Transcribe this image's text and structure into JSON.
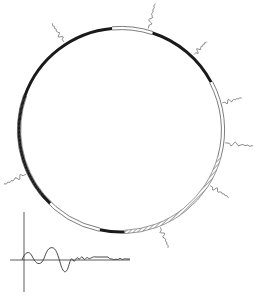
{
  "diagram": {
    "type": "circular-map",
    "colors": {
      "background": "#ffffff",
      "ink": "#1a1a1a",
      "faint": "#8a8a8a"
    },
    "circle": {
      "cx": 121,
      "cy": 130,
      "r": 102
    },
    "segments": [
      {
        "name": "segment-solid-left",
        "style": "solid",
        "start_deg": 134,
        "end_deg": 265
      },
      {
        "name": "segment-double-upper-left",
        "style": "double",
        "start_deg": 265,
        "end_deg": 288
      },
      {
        "name": "segment-solid-top",
        "style": "solid",
        "start_deg": 288,
        "end_deg": 332
      },
      {
        "name": "segment-double-upper-right",
        "style": "double",
        "start_deg": 332,
        "end_deg": 375
      },
      {
        "name": "segment-hatched-right-upper",
        "style": "hatched",
        "start_deg": 375,
        "end_deg": 448
      },
      {
        "name": "segment-solid-right",
        "style": "solid",
        "start_deg": 448,
        "end_deg": 462
      },
      {
        "name": "segment-double-lower-right",
        "style": "double",
        "start_deg": 462,
        "end_deg": 500
      },
      {
        "name": "segment-hatched-lower-right",
        "style": "hatched",
        "start_deg": 500,
        "end_deg": 494
      }
    ],
    "markers": [
      {
        "name": "waveform-marker-top",
        "angle_deg": 285,
        "length": 26
      },
      {
        "name": "waveform-marker-upper-left",
        "angle_deg": 237,
        "length": 22
      },
      {
        "name": "waveform-marker-upper-right",
        "angle_deg": 314,
        "length": 18
      },
      {
        "name": "waveform-marker-right-upper",
        "angle_deg": 345,
        "length": 20
      },
      {
        "name": "waveform-marker-right",
        "angle_deg": 7,
        "length": 30
      },
      {
        "name": "waveform-marker-right-lower",
        "angle_deg": 32,
        "length": 22
      },
      {
        "name": "waveform-marker-bottom",
        "angle_deg": 68,
        "length": 22
      },
      {
        "name": "waveform-marker-left",
        "angle_deg": 155,
        "length": 24
      }
    ],
    "inset_plot": {
      "origin_x": 24,
      "origin_y": 260,
      "y_axis_top": 212,
      "y_axis_bottom": 292,
      "x_axis_left": 10,
      "x_axis_right": 130
    }
  }
}
